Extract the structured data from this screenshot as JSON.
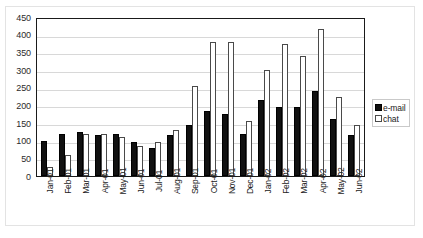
{
  "chart_data": {
    "type": "bar",
    "title": "",
    "subtitle": "",
    "xlabel": "",
    "ylabel": "",
    "ylim": [
      0,
      450
    ],
    "ytick_step": 50,
    "yticks": [
      450,
      400,
      350,
      300,
      250,
      200,
      150,
      100,
      50,
      0
    ],
    "grid": true,
    "legend_position": "right",
    "categories": [
      "Jan-01",
      "Feb-01",
      "Mar-01",
      "Apr-01",
      "May-01",
      "Jun-01",
      "Jul-01",
      "Aug-01",
      "Sep-01",
      "Oct-01",
      "Nov-01",
      "Dec-01",
      "Jan-02",
      "Feb-02",
      "Mar-02",
      "Apr-02",
      "May-02",
      "Jun-02"
    ],
    "series": [
      {
        "name": "e-mail",
        "color": "#111111",
        "values": [
          100,
          120,
          125,
          115,
          120,
          95,
          80,
          115,
          145,
          185,
          175,
          120,
          215,
          195,
          195,
          240,
          160,
          115
        ]
      },
      {
        "name": "chat",
        "color": "#ffffff",
        "values": [
          25,
          60,
          120,
          120,
          110,
          85,
          95,
          130,
          255,
          380,
          380,
          155,
          300,
          375,
          340,
          415,
          225,
          145
        ]
      }
    ]
  },
  "legend": {
    "items": [
      {
        "label": "e-mail",
        "swatch": "filled-black-square"
      },
      {
        "label": "chat",
        "swatch": "outlined-white-square"
      }
    ]
  },
  "colors": {
    "email_bar": "#111111",
    "chat_bar": "#ffffff",
    "chat_bar_border": "#4a4a4a",
    "axis": "#1a1a1a",
    "gridline": "#d8d8d8",
    "background": "#ffffff",
    "text": "#222222"
  }
}
